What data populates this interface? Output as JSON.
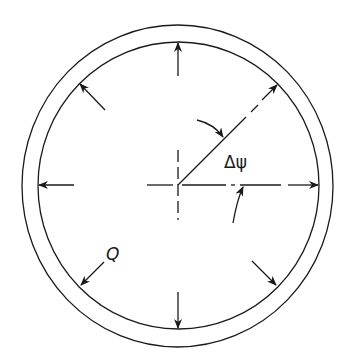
{
  "figure": {
    "type": "pipe cross-section with uniform internal pressure",
    "labels": {
      "angle": "Δψ",
      "load": "Q"
    },
    "colors": {
      "line": "#1a1a1a",
      "background": "#ffffff"
    },
    "arrows": {
      "count": 8,
      "direction": "radially outward",
      "angles_deg": [
        0,
        45,
        90,
        135,
        180,
        225,
        270,
        315
      ]
    }
  }
}
